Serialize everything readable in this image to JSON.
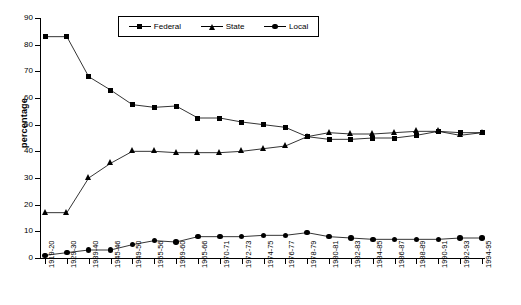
{
  "chart_data": {
    "type": "line",
    "title": "",
    "xlabel": "",
    "ylabel": "percentage",
    "ylim": [
      0,
      90
    ],
    "ytick_step": 10,
    "yticks": [
      0,
      10,
      20,
      30,
      40,
      50,
      60,
      70,
      80,
      90
    ],
    "grid": false,
    "legend_position": "top-center",
    "categories": [
      "1919-20",
      "1929-30",
      "1939-40",
      "1945-46",
      "1949-50",
      "1955-56",
      "1959-60",
      "1965-66",
      "1970-71",
      "1972-73",
      "1974-75",
      "1976-77",
      "1978-79",
      "1980-81",
      "1982-83",
      "1984-85",
      "1986-87",
      "1988-89",
      "1990-91",
      "1992-93",
      "1994-95"
    ],
    "series": [
      {
        "name": "Federal",
        "marker": "square",
        "values": [
          83,
          83,
          68,
          63,
          57.5,
          56.5,
          57,
          52.5,
          52.5,
          51,
          50,
          49,
          45.5,
          44.5,
          44.5,
          45,
          45,
          46,
          47.5,
          47,
          47
        ]
      },
      {
        "name": "State",
        "marker": "triangle",
        "values": [
          17,
          17,
          30,
          35.5,
          40,
          40,
          39.5,
          39.5,
          39.5,
          40,
          41,
          42,
          45.5,
          47,
          46.5,
          46.5,
          47,
          47.5,
          47.5,
          46,
          47
        ]
      },
      {
        "name": "Local",
        "marker": "circle",
        "values": [
          1,
          2,
          3,
          3,
          5,
          6.5,
          6,
          8,
          8,
          8,
          8.5,
          8.5,
          9.5,
          8,
          7.5,
          7,
          7,
          7,
          7,
          7.5,
          7.5
        ]
      }
    ]
  },
  "axis": {
    "y_title": "percentage"
  },
  "legend": {
    "items": [
      {
        "label": "Federal",
        "marker": "square"
      },
      {
        "label": "State",
        "marker": "triangle"
      },
      {
        "label": "Local",
        "marker": "circle"
      }
    ]
  }
}
